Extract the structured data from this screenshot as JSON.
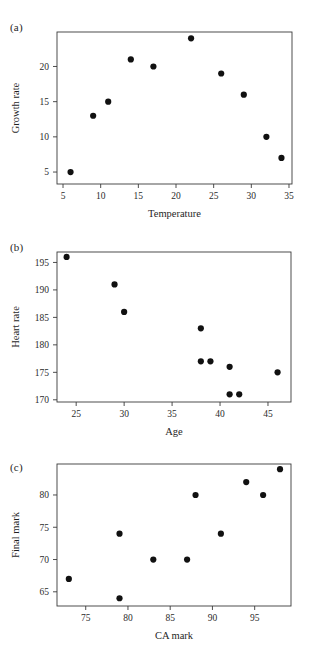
{
  "figure": {
    "width": 309,
    "height": 660,
    "background": "#ffffff",
    "marker_color": "#111111",
    "axis_color": "#3a3a3a"
  },
  "panels": [
    {
      "letter": "(a)"
    },
    {
      "letter": "(b)"
    },
    {
      "letter": "(c)"
    }
  ],
  "chart_data": [
    {
      "type": "scatter",
      "panel": "(a)",
      "title": "",
      "xlabel": "Temperature",
      "ylabel": "Growth rate",
      "xlim": [
        4.2,
        35.4
      ],
      "ylim": [
        3.3,
        24.9
      ],
      "xticks": [
        5,
        10,
        15,
        20,
        25,
        30,
        35
      ],
      "yticks": [
        5,
        10,
        15,
        20
      ],
      "xticklabels": [
        "5",
        "10",
        "15",
        "20",
        "25",
        "30",
        "35"
      ],
      "yticklabels": [
        "5",
        "10",
        "15",
        "20"
      ],
      "grid": false,
      "legend": null,
      "x": [
        6,
        9,
        11,
        14,
        17,
        22,
        26,
        29,
        32,
        34
      ],
      "y": [
        5,
        13,
        15,
        21,
        20,
        24,
        19,
        16,
        10,
        7
      ]
    },
    {
      "type": "scatter",
      "panel": "(b)",
      "title": "",
      "xlabel": "Age",
      "ylabel": "Heart rate",
      "xlim": [
        23.0,
        47.4
      ],
      "ylim": [
        169.6,
        196.9
      ],
      "xticks": [
        25,
        30,
        35,
        40,
        45
      ],
      "yticks": [
        170,
        175,
        180,
        185,
        190,
        195
      ],
      "xticklabels": [
        "25",
        "30",
        "35",
        "40",
        "45"
      ],
      "yticklabels": [
        "170",
        "175",
        "180",
        "185",
        "190",
        "195"
      ],
      "grid": false,
      "legend": null,
      "x": [
        24,
        29,
        30,
        38,
        38,
        39,
        41,
        41,
        42,
        46
      ],
      "y": [
        196,
        191,
        186,
        183,
        177,
        177,
        176,
        171,
        171,
        175
      ]
    },
    {
      "type": "scatter",
      "panel": "(c)",
      "title": "",
      "xlabel": "CA mark",
      "ylabel": "Final mark",
      "xlim": [
        71.6,
        99.3
      ],
      "ylim": [
        62.8,
        84.8
      ],
      "xticks": [
        75,
        80,
        85,
        90,
        95
      ],
      "yticks": [
        65,
        70,
        75,
        80
      ],
      "xticklabels": [
        "75",
        "80",
        "85",
        "90",
        "95"
      ],
      "yticklabels": [
        "65",
        "70",
        "75",
        "80"
      ],
      "grid": false,
      "legend": null,
      "x": [
        73,
        79,
        79,
        83,
        87,
        88,
        91,
        94,
        96,
        98
      ],
      "y": [
        67,
        74,
        64,
        70,
        70,
        80,
        74,
        82,
        80,
        84
      ]
    }
  ]
}
